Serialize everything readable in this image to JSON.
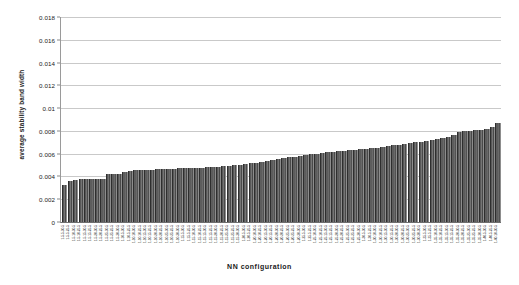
{
  "chart_data": {
    "type": "bar",
    "title": "",
    "xlabel": "NN configuration",
    "ylabel": "average stability band width",
    "ylim": [
      0,
      0.018
    ],
    "yticks": [
      "0",
      "0.002",
      "0.004",
      "0.006",
      "0.008",
      "0.01",
      "0.012",
      "0.014",
      "0.016",
      "0.018"
    ],
    "ytick_values": [
      0,
      0.002,
      0.004,
      0.006,
      0.008,
      0.01,
      0.012,
      0.014,
      0.016,
      0.018
    ],
    "grid": "horizontal",
    "legend": "none",
    "bar_color": "#555555",
    "categories": [
      "1-5-5-30-5",
      "1-5-5-25-5",
      "1-5-10-30-5",
      "1-5-10-25-5",
      "1-5-15-30-5",
      "1-5-15-25-5",
      "1-5-20-30-5",
      "1-5-20-25-5",
      "1-5-25-30-5",
      "1-5-25-25-5",
      "1-5-30-30-5",
      "1-10-5-30-5",
      "1-10-5-25-5",
      "1-10-10-30-5",
      "1-10-10-25-5",
      "1-10-15-30-5",
      "1-10-15-25-5",
      "1-10-20-30-5",
      "1-10-20-25-5",
      "1-10-25-30-5",
      "1-10-25-25-5",
      "1-10-30-30-5",
      "1-15-5-30-5",
      "1-15-5-25-5",
      "1-15-10-30-5",
      "1-15-10-25-5",
      "1-15-15-30-5",
      "1-15-15-25-5",
      "1-15-20-30-5",
      "1-15-20-25-5",
      "1-15-25-30-5",
      "1-15-25-25-5",
      "1-15-30-30-5",
      "1-20-5-30-5",
      "1-20-5-25-5",
      "1-20-10-30-5",
      "1-20-10-25-5",
      "1-20-15-30-5",
      "1-20-15-25-5",
      "1-20-20-30-5",
      "1-20-20-25-5",
      "1-20-25-30-5",
      "1-20-25-25-5",
      "1-20-30-30-5",
      "1-25-5-30-5",
      "1-25-5-25-5",
      "1-25-10-30-5",
      "1-25-10-25-5",
      "1-25-15-30-5",
      "1-25-15-25-5",
      "1-25-20-30-5",
      "1-25-20-25-5",
      "1-25-25-30-5",
      "1-25-25-25-5",
      "1-25-30-30-5",
      "1-30-5-30-5",
      "1-30-5-25-5",
      "1-30-10-30-5",
      "1-30-10-25-5",
      "1-30-15-30-5",
      "1-30-15-25-5",
      "1-30-20-30-5",
      "1-30-20-25-5",
      "1-30-25-30-5",
      "1-30-25-25-5",
      "1-30-30-30-5",
      "1-35-5-30-5",
      "1-35-5-25-5",
      "1-35-10-30-5",
      "1-35-10-25-5",
      "1-35-15-30-5",
      "1-35-15-25-5",
      "1-35-20-30-5",
      "1-35-20-25-5",
      "1-35-25-30-5",
      "1-35-25-25-5",
      "1-35-30-30-5",
      "1-40-5-30-5",
      "1-40-5-25-5",
      "1-40-10-30-5"
    ],
    "values": [
      0.00325,
      0.0036,
      0.00373,
      0.00378,
      0.00378,
      0.0038,
      0.0038,
      0.00382,
      0.00418,
      0.0042,
      0.00425,
      0.0044,
      0.00452,
      0.00455,
      0.00458,
      0.00458,
      0.0046,
      0.00462,
      0.00462,
      0.00465,
      0.00468,
      0.0047,
      0.0047,
      0.00472,
      0.00475,
      0.00478,
      0.0048,
      0.00482,
      0.00485,
      0.0049,
      0.00495,
      0.005,
      0.00505,
      0.0051,
      0.00515,
      0.00522,
      0.0053,
      0.0054,
      0.00548,
      0.00555,
      0.00562,
      0.00568,
      0.00575,
      0.0058,
      0.00588,
      0.00595,
      0.006,
      0.00608,
      0.00612,
      0.00618,
      0.00622,
      0.00625,
      0.00628,
      0.00632,
      0.00638,
      0.00642,
      0.00648,
      0.00652,
      0.00658,
      0.00665,
      0.00672,
      0.0068,
      0.00688,
      0.00695,
      0.007,
      0.00705,
      0.00712,
      0.0072,
      0.00728,
      0.00738,
      0.00748,
      0.0076,
      0.0079,
      0.008,
      0.00802,
      0.00805,
      0.00808,
      0.00818,
      0.00838,
      0.0087
    ]
  }
}
